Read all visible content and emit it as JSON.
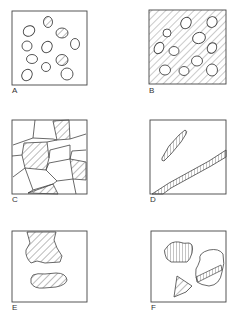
{
  "figure": {
    "panels": [
      {
        "id": "A",
        "label": "A",
        "description": "Scattered oval inclusions, three hatched, in clear matrix"
      },
      {
        "id": "B",
        "label": "B",
        "description": "Clear oval inclusions in hatched matrix"
      },
      {
        "id": "C",
        "label": "C",
        "description": "Polygonal grain network with some hatched grains"
      },
      {
        "id": "D",
        "label": "D",
        "description": "Elongated segmented bands crossing field"
      },
      {
        "id": "E",
        "label": "E",
        "description": "Two irregular hatched patches"
      },
      {
        "id": "F",
        "label": "F",
        "description": "Irregular fragments with varied hatching"
      }
    ]
  },
  "colors": {
    "line": "#444444",
    "background": "#ffffff"
  }
}
